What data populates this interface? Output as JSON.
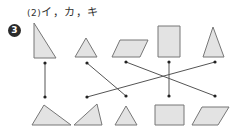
{
  "answer": {
    "part_label": "(2)",
    "text": "イ，カ，キ"
  },
  "question": {
    "number": "3"
  },
  "colors": {
    "shape_fill": "#e3e3e3",
    "shape_stroke": "#777777",
    "line": "#555555",
    "dot": "#222222"
  },
  "top_shapes": [
    {
      "id": "top-1",
      "type": "right-triangle",
      "points": "34,23 34,58 56,58"
    },
    {
      "id": "top-2",
      "type": "small-triangle",
      "points": "86,38 75,57 97,57"
    },
    {
      "id": "top-3",
      "type": "parallelogram",
      "points": "120,40 148,40 140,57 112,57"
    },
    {
      "id": "top-4",
      "type": "rectangle",
      "points": "158,26 180,26 180,57 158,57"
    },
    {
      "id": "top-5",
      "type": "isosceles-triangle",
      "points": "213,27 224,57 203,57"
    }
  ],
  "bottom_shapes": [
    {
      "id": "bottom-1",
      "type": "obtuse-triangle",
      "points": "44,105 71,125 32,125"
    },
    {
      "id": "bottom-2",
      "type": "acute-triangle",
      "points": "97,104 102,125 74,125"
    },
    {
      "id": "bottom-3",
      "type": "small-triangle",
      "points": "126,106 137,125 115,125"
    },
    {
      "id": "bottom-4",
      "type": "rectangle",
      "points": "155,105 184,105 184,125 155,125"
    },
    {
      "id": "bottom-5",
      "type": "parallelogram",
      "points": "202,107 229,107 218,125 192,125"
    }
  ],
  "top_dots": [
    [
      45,
      63
    ],
    [
      87,
      63
    ],
    [
      126,
      62
    ],
    [
      169,
      62
    ],
    [
      215,
      62
    ]
  ],
  "bottom_dots": [
    [
      45,
      97
    ],
    [
      87,
      97
    ],
    [
      126,
      96
    ],
    [
      169,
      96
    ],
    [
      215,
      96
    ]
  ],
  "connections": [
    {
      "from": 0,
      "to": 0
    },
    {
      "from": 1,
      "to": 2
    },
    {
      "from": 2,
      "to": 4
    },
    {
      "from": 3,
      "to": 3
    },
    {
      "from": 4,
      "to": 1
    }
  ]
}
